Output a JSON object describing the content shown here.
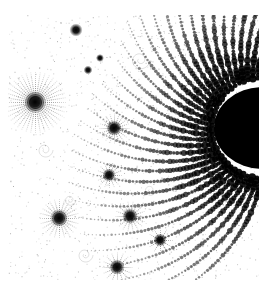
{
  "image": {
    "description": "Grayscale fractal (Mandelbrot set detail) with black bulb at right edge and radiating spiral filaments",
    "background": "#ffffff",
    "foreground": "#000000",
    "bounds": {
      "x0": 8,
      "y0": 15,
      "x1": 259,
      "y1": 280
    },
    "main_bulb": {
      "cx": 262,
      "cy": 128,
      "r": 48
    },
    "minibrots": [
      {
        "x": 35,
        "y": 102,
        "r": 5,
        "rays": 40,
        "ray_len": 26
      },
      {
        "x": 76,
        "y": 30,
        "r": 3,
        "rays": 0,
        "ray_len": 0
      },
      {
        "x": 114,
        "y": 128,
        "r": 3.5,
        "rays": 20,
        "ray_len": 12
      },
      {
        "x": 109,
        "y": 175,
        "r": 3,
        "rays": 16,
        "ray_len": 10
      },
      {
        "x": 59,
        "y": 218,
        "r": 4,
        "rays": 24,
        "ray_len": 16
      },
      {
        "x": 130,
        "y": 216,
        "r": 3.5,
        "rays": 18,
        "ray_len": 12
      },
      {
        "x": 117,
        "y": 267,
        "r": 3.5,
        "rays": 16,
        "ray_len": 12
      },
      {
        "x": 160,
        "y": 240,
        "r": 3,
        "rays": 12,
        "ray_len": 10
      },
      {
        "x": 88,
        "y": 70,
        "r": 2,
        "rays": 0,
        "ray_len": 0
      },
      {
        "x": 100,
        "y": 58,
        "r": 1.8,
        "rays": 0,
        "ray_len": 0
      }
    ]
  }
}
